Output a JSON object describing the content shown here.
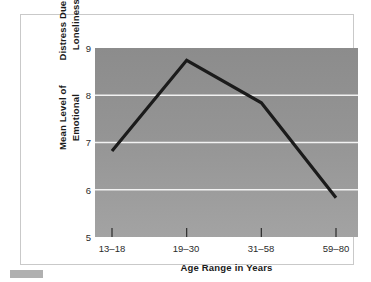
{
  "chart_data": {
    "type": "line",
    "title": "",
    "xlabel": "Age Range in Years",
    "ylabel": "Mean Level of Emotional Distress Due to Loneliness",
    "ylabel_lines": [
      "Mean Level of Emotional",
      "Distress Due to Loneliness"
    ],
    "categories": [
      "13–18",
      "19–30",
      "31–58",
      "59–80"
    ],
    "values": [
      6.82,
      8.74,
      7.84,
      5.83
    ],
    "ylim": [
      5,
      9
    ],
    "yticks": [
      9,
      8,
      7,
      6,
      5
    ],
    "ytick_labels": [
      "9",
      "8",
      "7",
      "6",
      "5"
    ],
    "grid": true,
    "gridlines_at": [
      8,
      7,
      6
    ],
    "legend": null,
    "legend_position": "none",
    "series": [
      {
        "name": "Mean emotional distress",
        "values": [
          6.82,
          8.74,
          7.84,
          5.83
        ]
      }
    ]
  },
  "style": {
    "line_color": "#1b1b1b",
    "grid_color": "#f2f2f2",
    "plot_bg_top": "#8c8c8c",
    "plot_bg_bottom": "#a3a3a3",
    "frame_border": "#c9c9c9",
    "text_color": "#1a1a1a",
    "marker_color": "#b0b0b0",
    "page_bg": "#ffffff"
  }
}
